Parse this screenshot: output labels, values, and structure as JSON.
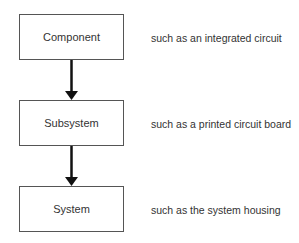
{
  "diagram": {
    "type": "hierarchy-flow",
    "levels": [
      {
        "label": "Component",
        "description": "such as an integrated circuit"
      },
      {
        "label": "Subsystem",
        "description": "such as a printed circuit board"
      },
      {
        "label": "System",
        "description": "such as the system housing"
      }
    ],
    "edges": [
      {
        "from": "Component",
        "to": "Subsystem"
      },
      {
        "from": "Subsystem",
        "to": "System"
      }
    ],
    "colors": {
      "line": "#111111",
      "box_border": "#555555",
      "text": "#333333"
    }
  }
}
